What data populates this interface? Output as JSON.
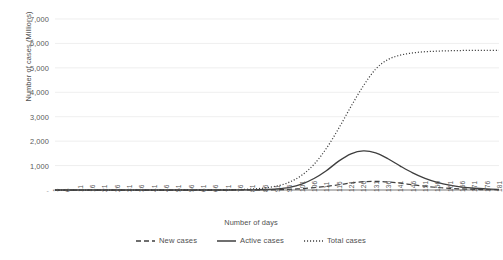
{
  "chart_data": {
    "type": "line",
    "title": "",
    "xlabel": "Number of days",
    "ylabel": "Number of cases (Millions)",
    "xlim": [
      1,
      181
    ],
    "ylim": [
      0,
      7000
    ],
    "grid": true,
    "legend_position": "bottom",
    "y_ticks": [
      "7,000",
      "6,000",
      "5,000",
      "4,000",
      "3,000",
      "2,000",
      "1,000",
      "-"
    ],
    "y_tick_values": [
      7000,
      6000,
      5000,
      4000,
      3000,
      2000,
      1000,
      0
    ],
    "x_ticks": [
      "1",
      "6",
      "11",
      "16",
      "21",
      "26",
      "31",
      "36",
      "41",
      "46",
      "51",
      "56",
      "61",
      "66",
      "71",
      "76",
      "81",
      "86",
      "91",
      "96",
      "101",
      "106",
      "111",
      "116",
      "121",
      "126",
      "131",
      "136",
      "141",
      "146",
      "151",
      "156",
      "161",
      "166",
      "171",
      "176",
      "181"
    ],
    "x": [
      1,
      6,
      11,
      16,
      21,
      26,
      31,
      36,
      41,
      46,
      51,
      56,
      61,
      66,
      71,
      76,
      81,
      86,
      91,
      96,
      101,
      106,
      111,
      116,
      121,
      126,
      131,
      136,
      141,
      146,
      151,
      156,
      161,
      166,
      171,
      176,
      181
    ],
    "series": [
      {
        "name": "New cases",
        "style": "dashed",
        "color": "#3f3f3f",
        "values": [
          0,
          0,
          0,
          0,
          0,
          0,
          0,
          0,
          0,
          0,
          0,
          0,
          0,
          0,
          0,
          1,
          2,
          5,
          12,
          28,
          55,
          95,
          150,
          215,
          285,
          340,
          355,
          330,
          280,
          215,
          155,
          105,
          68,
          42,
          26,
          15,
          9
        ]
      },
      {
        "name": "Active cases",
        "style": "solid",
        "color": "#3f3f3f",
        "values": [
          0,
          0,
          0,
          0,
          0,
          0,
          0,
          0,
          0,
          0,
          0,
          0,
          0,
          0,
          1,
          3,
          8,
          20,
          48,
          110,
          240,
          470,
          790,
          1180,
          1480,
          1600,
          1520,
          1280,
          980,
          700,
          475,
          310,
          196,
          120,
          72,
          43,
          25
        ]
      },
      {
        "name": "Total cases",
        "style": "dotted",
        "color": "#3f3f3f",
        "values": [
          0,
          0,
          0,
          0,
          0,
          0,
          0,
          0,
          0,
          0,
          0,
          1,
          2,
          4,
          9,
          19,
          40,
          82,
          165,
          320,
          600,
          1050,
          1700,
          2520,
          3420,
          4260,
          4950,
          5340,
          5520,
          5610,
          5660,
          5685,
          5700,
          5710,
          5715,
          5718,
          5720
        ]
      }
    ]
  },
  "legend": {
    "items": [
      {
        "label": "New cases",
        "style": "dashed"
      },
      {
        "label": "Active cases",
        "style": "solid"
      },
      {
        "label": "Total cases",
        "style": "dotted"
      }
    ]
  }
}
